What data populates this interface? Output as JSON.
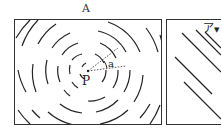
{
  "figure": {
    "title": "A",
    "left_panel": {
      "description": "star trails circling around the celestial pole",
      "center_label": "P",
      "angle_label": "a"
    },
    "right_panel": {
      "corner_label": "ア",
      "arrow": "▼"
    },
    "colors": {
      "stroke": "#222222",
      "background": "#ffffff"
    }
  }
}
